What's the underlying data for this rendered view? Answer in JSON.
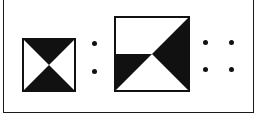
{
  "figure": {
    "type": "visual-analogy-puzzle",
    "title": "Geometric analogy: A is to B as",
    "background_color": "#ffffff",
    "ink_color": "#111111",
    "frame": {
      "name": "panel-frame",
      "border_color": "#1a1a1a",
      "border_width_px": 1
    },
    "figure_a": {
      "label": "A",
      "shape": "square",
      "size_px": 54,
      "fill": "#ffffff",
      "outline_color": "#111111",
      "pattern": "hourglass-bowtie-vertical",
      "description": "Square with a black triangle occupying the upper half apexing at center and a black triangle occupying the lower half apexing at center, forming a vertical bowtie.",
      "black_regions": [
        {
          "name": "upper-triangle",
          "points": "0,0 100,0 50,50"
        },
        {
          "name": "lower-triangle",
          "points": "0,100 100,100 50,50"
        }
      ]
    },
    "separator": {
      "name": "analogy-colon",
      "glyph": ":",
      "dot_count": 2,
      "meaning": "is to"
    },
    "figure_b": {
      "label": "B",
      "shape": "square",
      "size_px": 76,
      "fill": "#ffffff",
      "outline_color": "#111111",
      "pattern": "diagonal-bowtie-rotated",
      "description": "Square with a black triangle along the right edge apexing at center and a small black triangle on the lower-left edge apexing at center, forming a bowtie rotated along the main diagonal.",
      "black_regions": [
        {
          "name": "right-triangle",
          "points": "100,0 100,100 50,50"
        },
        {
          "name": "lower-left-triangle",
          "points": "0,50 0,100 50,50"
        }
      ]
    },
    "proportion_marker": {
      "name": "proportion-dots",
      "glyph": "::",
      "dot_count": 4,
      "arrangement": "2x2",
      "meaning": "as"
    }
  }
}
